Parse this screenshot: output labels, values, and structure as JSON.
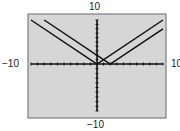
{
  "chart_data": {
    "type": "line",
    "title": "",
    "xlabel": "",
    "ylabel": "",
    "xlim": [
      -10,
      10
    ],
    "ylim": [
      -10,
      10
    ],
    "tick_labels": {
      "x_min": "−10",
      "x_max": "10",
      "y_min": "−10",
      "y_max": "10"
    },
    "grid": false,
    "tick_marks_every": 1,
    "series": [
      {
        "name": "y = |x|",
        "x": [
          -10,
          0,
          10
        ],
        "y": [
          10,
          0,
          10
        ]
      },
      {
        "name": "y = |x - 2|",
        "x": [
          -8,
          2,
          10
        ],
        "y": [
          10,
          0,
          8
        ]
      }
    ],
    "colors": {
      "background": "#d6d6d6",
      "line": "#111111",
      "frame": "#555555"
    }
  }
}
